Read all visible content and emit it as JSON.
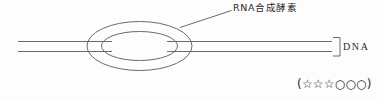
{
  "figure": {
    "title_label": "RNA合成酵素",
    "dna_label": "DNA",
    "rating_text": "(☆☆☆○○○)",
    "colors": {
      "background": "#fdfdfd",
      "stroke": "#6b6b6b",
      "text": "#2a2a2a"
    },
    "elements": {
      "outer_ellipse_name": "rna-polymerase-outer-ellipse",
      "inner_ellipse_name": "transcription-bubble-ellipse",
      "strand_upper_name": "dna-strand-upper",
      "strand_lower_name": "dna-strand-lower",
      "bracket_name": "dna-bracket",
      "leader_name": "enzyme-leader-line"
    }
  }
}
